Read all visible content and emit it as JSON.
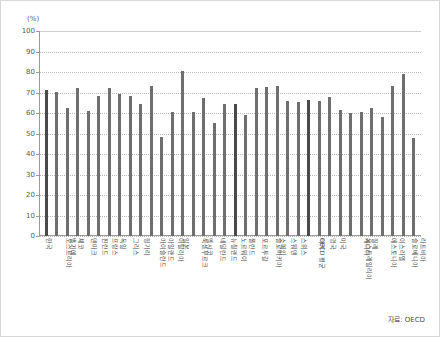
{
  "chart_data": {
    "type": "bar",
    "title": "",
    "subtitle": "",
    "xlabel": "",
    "ylabel": "(%)",
    "unit_label": "(%)",
    "ylim": [
      0,
      100
    ],
    "yticks": [
      0,
      10,
      20,
      30,
      40,
      50,
      60,
      70,
      80,
      90,
      100
    ],
    "ytick_labels": [
      "0",
      "10",
      "20",
      "30",
      "40",
      "50",
      "60",
      "70",
      "80",
      "90",
      "100"
    ],
    "grid": true,
    "grid_axis": "y",
    "legend": false,
    "legend_position": "none",
    "bar_color": "#6e6e6e",
    "highlight_color": "#4a4a4a",
    "categories": [
      "한국",
      "오스트리아",
      "벨기에",
      "체코",
      "덴마크",
      "핀란드",
      "프랑스",
      "독일",
      "그리스",
      "헝가리",
      "아이슬란드",
      "아일랜드",
      "이탈리아",
      "일본",
      "룩셈부르크",
      "멕시코",
      "네덜란드",
      "뉴질랜드",
      "노르웨이",
      "폴란드",
      "포르투갈",
      "슬로바키아",
      "스페인",
      "스웨덴",
      "스위스",
      "OECD 평균",
      "터키",
      "영국",
      "미국",
      "오스트레일리아",
      "캐나다",
      "칠레",
      "에스토니아",
      "이스라엘",
      "슬로베니아",
      "라트비아"
    ],
    "values": [
      71.2,
      70.3,
      62.3,
      72.2,
      61.0,
      68.4,
      72.1,
      69.3,
      68.3,
      64.3,
      73.0,
      48.4,
      60.6,
      80.3,
      60.5,
      67.3,
      55.0,
      64.5,
      64.6,
      58.8,
      72.3,
      72.5,
      73.2,
      65.8,
      65.5,
      66.4,
      65.8,
      68.0,
      61.5,
      60.2,
      60.4,
      62.6,
      58.0,
      73.3,
      79.0,
      48.0
    ],
    "highlight_indices": [
      0,
      18,
      25
    ],
    "series": [
      {
        "name": "고용률",
        "values": [
          71.2,
          70.3,
          62.3,
          72.2,
          61.0,
          68.4,
          72.1,
          69.3,
          68.3,
          64.3,
          73.0,
          48.4,
          60.6,
          80.3,
          60.5,
          67.3,
          55.0,
          64.5,
          64.6,
          58.8,
          72.3,
          72.5,
          73.2,
          65.8,
          65.5,
          66.4,
          65.8,
          68.0,
          61.5,
          60.2,
          60.4,
          62.6,
          58.0,
          73.3,
          79.0,
          48.0
        ]
      }
    ]
  },
  "source": {
    "note": "자료: OECD"
  }
}
